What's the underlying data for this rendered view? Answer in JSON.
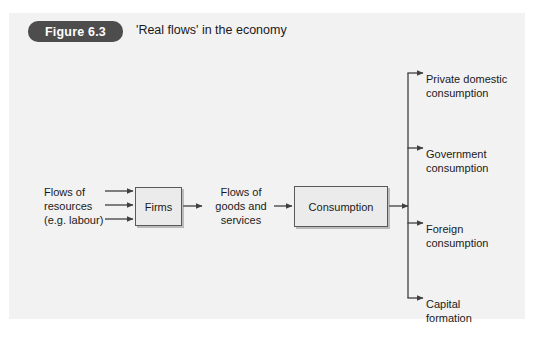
{
  "figure": {
    "badge": "Figure 6.3",
    "title": "'Real flows' in the economy"
  },
  "diagram": {
    "input_label": "Flows of\nresources\n(e.g. labour)",
    "input_lines": [
      "Flows of",
      "resources",
      "(e.g. labour)"
    ],
    "middle_label_lines": [
      "Flows of",
      "goods and",
      "services"
    ],
    "nodes": [
      {
        "id": "firms",
        "label": "Firms"
      },
      {
        "id": "consumption",
        "label": "Consumption"
      }
    ],
    "branches": [
      {
        "lines": [
          "Private domestic",
          "consumption"
        ]
      },
      {
        "lines": [
          "Government",
          "consumption"
        ]
      },
      {
        "lines": [
          "Foreign",
          "consumption"
        ]
      },
      {
        "lines": [
          "Capital",
          "formation"
        ]
      }
    ]
  },
  "colors": {
    "panel_background": "#f2f2f2",
    "badge_background": "#4d4d4d",
    "badge_text": "#ffffff",
    "node_fill": "#ebebeb",
    "node_border": "#58595b",
    "line": "#3f3f3f",
    "text": "#1a1a1a"
  }
}
